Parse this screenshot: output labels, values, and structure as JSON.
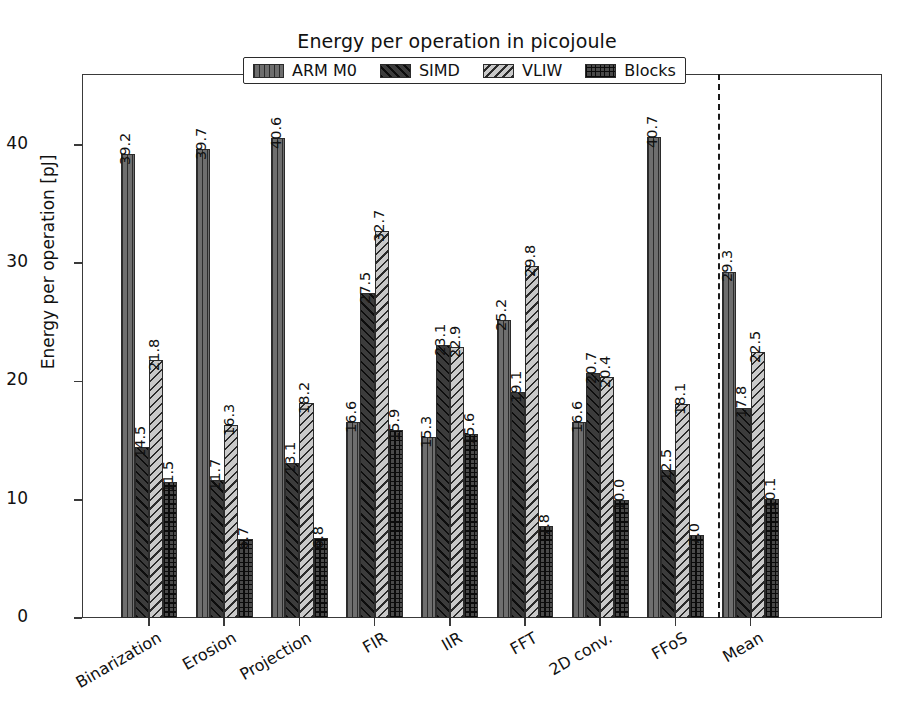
{
  "chart_data": {
    "type": "bar",
    "title": "Energy per operation in picojoule",
    "xlabel": "",
    "ylabel": "Energy per operation [pJ]",
    "ylim": [
      0,
      46
    ],
    "yticks": [
      0,
      10,
      20,
      30,
      40
    ],
    "ytick_labels": [
      "0",
      "10",
      "20",
      "30",
      "40"
    ],
    "grid": false,
    "legend_position": "upper center (outside, overlapping top spine)",
    "categories": [
      "Binarization",
      "Erosion",
      "Projection",
      "FIR",
      "IIR",
      "FFT",
      "2D conv.",
      "FFoS",
      "Mean"
    ],
    "series": [
      {
        "name": "ARM M0",
        "hatch": "vertical-lines",
        "color": "#6e6e6e",
        "values": [
          39.2,
          39.7,
          40.6,
          16.6,
          15.3,
          25.2,
          16.6,
          40.7,
          29.3
        ],
        "labels": [
          "39.2",
          "39.7",
          "40.6",
          "16.6",
          "15.3",
          "25.2",
          "16.6",
          "40.7",
          "29.3"
        ]
      },
      {
        "name": "SIMD",
        "hatch": "back-diagonal",
        "color": "#3c3c3c",
        "values": [
          14.5,
          11.7,
          13.1,
          27.5,
          23.1,
          19.1,
          20.7,
          12.5,
          17.8
        ],
        "labels": [
          "14.5",
          "11.7",
          "13.1",
          "27.5",
          "23.1",
          "19.1",
          "20.7",
          "12.5",
          "17.8"
        ]
      },
      {
        "name": "VLIW",
        "hatch": "forward-diagonal",
        "color": "#c9c9c9",
        "values": [
          21.8,
          16.3,
          18.2,
          32.7,
          22.9,
          29.8,
          20.4,
          18.1,
          22.5
        ],
        "labels": [
          "21.8",
          "16.3",
          "18.2",
          "32.7",
          "22.9",
          "29.8",
          "20.4",
          "18.1",
          "22.5"
        ]
      },
      {
        "name": "Blocks",
        "hatch": "crosshatch-grid",
        "color": "#4a4a4a",
        "values": [
          11.5,
          6.7,
          6.8,
          15.9,
          15.6,
          7.8,
          10.0,
          7.0,
          10.1
        ],
        "labels": [
          "11.5",
          "6.7",
          "6.8",
          "15.9",
          "15.6",
          "7.8",
          "10.0",
          "7.0",
          "10.1"
        ]
      }
    ],
    "annotations": [
      {
        "name": "mean-divider",
        "type": "vertical-dashed-line",
        "after_category": "FFoS"
      }
    ]
  },
  "legend": {
    "items": [
      {
        "label": "ARM M0"
      },
      {
        "label": "SIMD"
      },
      {
        "label": "VLIW"
      },
      {
        "label": "Blocks"
      }
    ]
  }
}
